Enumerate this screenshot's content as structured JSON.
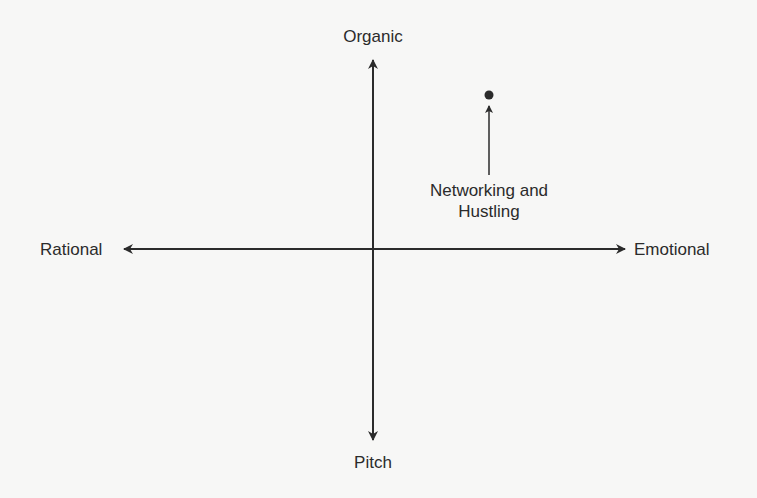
{
  "diagram": {
    "type": "quadrant-axes",
    "axes": {
      "vertical": {
        "top_label": "Organic",
        "bottom_label": "Pitch"
      },
      "horizontal": {
        "left_label": "Rational",
        "right_label": "Emotional"
      }
    },
    "points": [
      {
        "label": "Networking and\nHustling",
        "quadrant": "top-right",
        "marker": "filled-circle"
      }
    ],
    "colors": {
      "stroke": "#2b2b2b",
      "background": "#f7f7f6",
      "text": "#2b2b2b"
    }
  }
}
